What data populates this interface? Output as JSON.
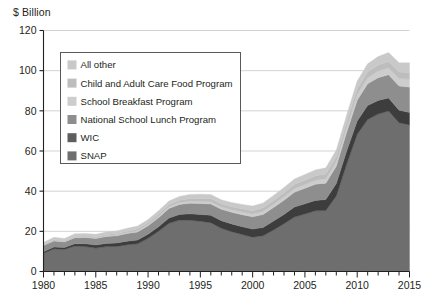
{
  "axis_title": "$ Billion",
  "legend": {
    "items": [
      {
        "label": "All other",
        "color": "#c9c9c9"
      },
      {
        "label": "Child and Adult Care Food Program",
        "color": "#bdbdbd"
      },
      {
        "label": "School Breakfast Program",
        "color": "#cdcdcd"
      },
      {
        "label": "National School Lunch Program",
        "color": "#8e8e8e"
      },
      {
        "label": "WIC",
        "color": "#5e5e5e"
      },
      {
        "label": "SNAP",
        "color": "#6e6e6e"
      }
    ]
  },
  "chart_data": {
    "type": "area",
    "title": "",
    "subtitle": "",
    "xlabel": "",
    "ylabel": "$ Billion",
    "stacked": true,
    "grid": true,
    "legend_position": "inside-top-left",
    "xlim": [
      1980,
      2015
    ],
    "ylim": [
      0,
      120
    ],
    "ytick_values": [
      0,
      20,
      40,
      60,
      80,
      100,
      120
    ],
    "ytick_labels": [
      "0",
      "20",
      "40",
      "60",
      "80",
      "100",
      "120"
    ],
    "xtick_values": [
      1980,
      1985,
      1990,
      1995,
      2000,
      2005,
      2010,
      2015
    ],
    "xtick_labels": [
      "1980",
      "1985",
      "1990",
      "1995",
      "2000",
      "2005",
      "2010",
      "2015"
    ],
    "xtick_minor_step": 1,
    "x": [
      1980,
      1981,
      1982,
      1983,
      1984,
      1985,
      1986,
      1987,
      1988,
      1989,
      1990,
      1991,
      1992,
      1993,
      1994,
      1995,
      1996,
      1997,
      1998,
      1999,
      2000,
      2001,
      2002,
      2003,
      2004,
      2005,
      2006,
      2007,
      2008,
      2009,
      2010,
      2011,
      2012,
      2013,
      2014,
      2015
    ],
    "series": [
      {
        "name": "SNAP",
        "color": "#6e6e6e",
        "values": [
          9.1,
          11.3,
          11.0,
          12.7,
          12.4,
          11.7,
          12.4,
          12.5,
          13.3,
          13.8,
          16.5,
          20.0,
          24.0,
          25.6,
          25.5,
          25.0,
          24.3,
          21.5,
          19.8,
          18.4,
          17.1,
          17.8,
          20.7,
          23.8,
          27.1,
          28.6,
          30.2,
          30.4,
          37.6,
          53.6,
          68.3,
          75.7,
          78.4,
          79.9,
          74.1,
          73.0
        ]
      },
      {
        "name": "WIC",
        "color": "#3d3d3d",
        "values": [
          0.7,
          0.9,
          0.9,
          1.1,
          1.4,
          1.5,
          1.6,
          1.7,
          1.8,
          1.9,
          2.1,
          2.3,
          2.6,
          2.8,
          3.2,
          3.4,
          3.7,
          3.8,
          3.9,
          3.9,
          4.0,
          4.1,
          4.4,
          4.6,
          5.0,
          5.1,
          5.2,
          5.4,
          6.2,
          6.5,
          6.7,
          7.0,
          6.8,
          6.5,
          6.2,
          6.2
        ]
      },
      {
        "name": "National School Lunch Program",
        "color": "#8e8e8e",
        "values": [
          3.2,
          3.0,
          2.8,
          3.0,
          3.1,
          3.2,
          3.4,
          3.6,
          3.8,
          4.0,
          4.2,
          4.5,
          4.8,
          5.0,
          5.3,
          5.5,
          5.6,
          5.7,
          5.8,
          6.0,
          6.1,
          6.5,
          6.8,
          7.1,
          7.4,
          7.7,
          8.0,
          8.2,
          8.6,
          9.3,
          10.3,
          10.8,
          11.3,
          11.6,
          12.1,
          12.6
        ]
      },
      {
        "name": "School Breakfast Program",
        "color": "#cdcdcd",
        "values": [
          0.3,
          0.3,
          0.3,
          0.4,
          0.4,
          0.4,
          0.5,
          0.5,
          0.5,
          0.6,
          0.6,
          0.7,
          0.8,
          0.9,
          1.0,
          1.0,
          1.1,
          1.2,
          1.2,
          1.3,
          1.4,
          1.5,
          1.6,
          1.7,
          1.8,
          1.9,
          2.0,
          2.2,
          2.4,
          2.6,
          2.9,
          3.0,
          3.3,
          3.5,
          3.7,
          4.0
        ]
      },
      {
        "name": "Child and Adult Care Food Program",
        "color": "#bdbdbd",
        "values": [
          0.2,
          0.3,
          0.3,
          0.3,
          0.4,
          0.5,
          0.5,
          0.6,
          0.7,
          0.8,
          0.9,
          1.0,
          1.1,
          1.2,
          1.4,
          1.5,
          1.6,
          1.5,
          1.5,
          1.6,
          1.7,
          1.8,
          1.9,
          2.0,
          2.1,
          2.2,
          2.3,
          2.4,
          2.5,
          2.6,
          2.8,
          2.9,
          3.0,
          3.1,
          3.2,
          3.3
        ]
      },
      {
        "name": "All other",
        "color": "#c9c9c9",
        "values": [
          1.0,
          1.2,
          1.1,
          1.3,
          1.2,
          1.2,
          1.3,
          1.3,
          1.4,
          1.5,
          1.6,
          1.7,
          1.8,
          1.9,
          2.0,
          2.1,
          2.0,
          2.0,
          2.1,
          2.2,
          2.3,
          2.4,
          2.5,
          2.6,
          2.7,
          2.8,
          2.9,
          3.0,
          3.2,
          3.5,
          3.8,
          4.0,
          4.2,
          4.4,
          4.6,
          4.8
        ]
      }
    ]
  },
  "colors": {
    "axis": "#231f20",
    "grid": "#c8c8c8",
    "plot_background": "#ffffff",
    "legend_border": "#595959"
  }
}
